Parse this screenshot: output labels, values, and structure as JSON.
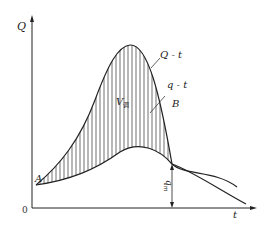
{
  "diagram": {
    "axis_y_label": "Q",
    "axis_x_label": "t",
    "origin_label": "0",
    "curve_inflow_label": "Q - t",
    "curve_outflow_label": "q - t",
    "point_a_label": "A",
    "point_b_label": "B",
    "volume_label": "V",
    "volume_subscript": "调",
    "qm_label": "q",
    "qm_subscript": "m"
  },
  "colors": {
    "line": "#222222",
    "hatch": "#333333",
    "background": "#ffffff"
  }
}
